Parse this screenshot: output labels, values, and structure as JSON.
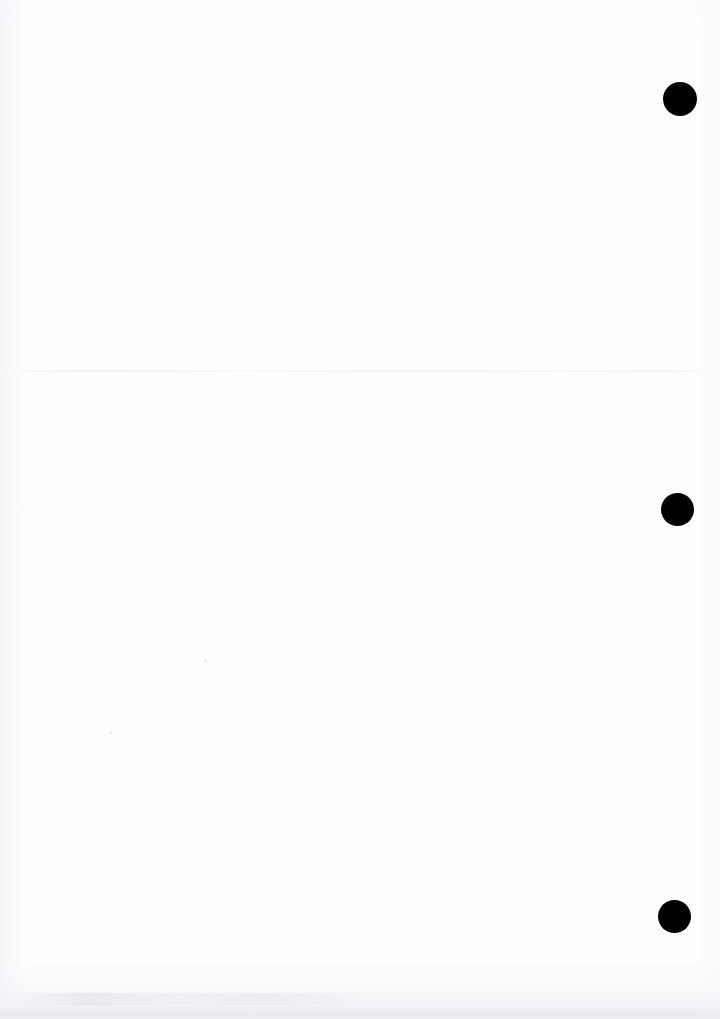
{
  "page": {
    "width": 720,
    "height": 1019,
    "background_color": "#fefeff",
    "content_text": ""
  },
  "marks": {
    "color": "#000000",
    "shape": "filled-circle",
    "count": 3,
    "items": [
      {
        "id": "mark-1",
        "cx": 680,
        "cy": 99,
        "diameter": 34
      },
      {
        "id": "mark-2",
        "cx": 677,
        "cy": 509,
        "diameter": 33
      },
      {
        "id": "mark-3",
        "cx": 674.5,
        "cy": 916.5,
        "diameter": 33
      }
    ]
  },
  "artifacts": {
    "scan_seam": {
      "y": 370
    },
    "bottom_smudge": {
      "y": 990,
      "height": 29
    },
    "specks": [
      {
        "id": "speck-1",
        "cx": 205,
        "cy": 660,
        "size": 3
      },
      {
        "id": "speck-2",
        "cx": 110,
        "cy": 732,
        "size": 3
      }
    ]
  }
}
